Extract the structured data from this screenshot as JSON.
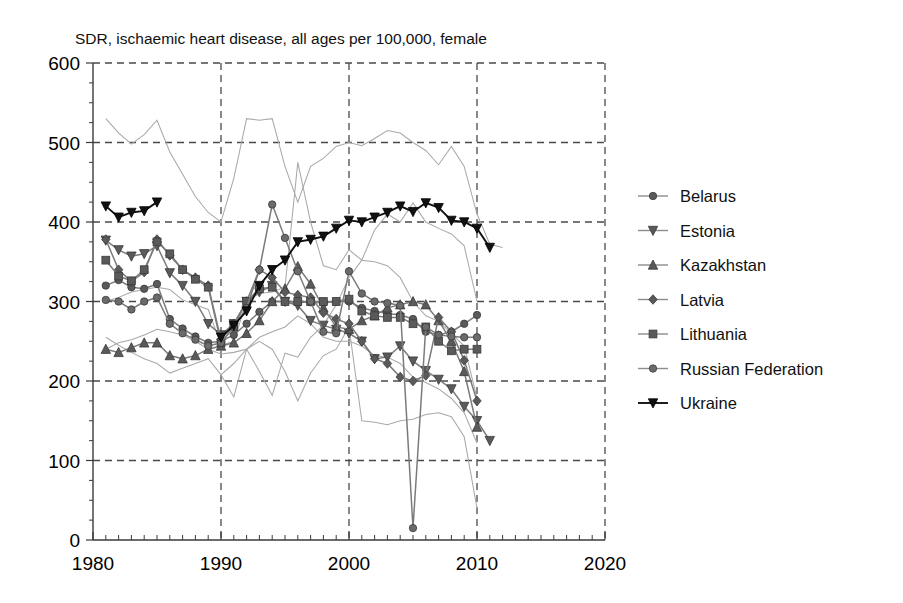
{
  "chart_data": {
    "type": "line",
    "title": "SDR, ischaemic heart disease, all ages per 100,000, female",
    "xlabel": "",
    "ylabel": "",
    "xlim": [
      1980,
      2020
    ],
    "ylim": [
      0,
      600
    ],
    "x_ticks": [
      "1980",
      "1990",
      "2000",
      "2010",
      "2020"
    ],
    "x_tick_values": [
      1980,
      1990,
      2000,
      2010,
      2020
    ],
    "y_ticks": [
      "0",
      "100",
      "200",
      "300",
      "400",
      "500",
      "600"
    ],
    "y_tick_values": [
      0,
      100,
      200,
      300,
      400,
      500,
      600
    ],
    "x_minor_interval": 1,
    "y_minor_interval": 25,
    "grid": "dashed-both-major",
    "legend_position": "right",
    "marker_color": "#5a5a5a",
    "line_color": "#7b7b7b",
    "thin_line_color": "#a9a9a9",
    "highlight_color": "#111111",
    "series": [
      {
        "name": "Belarus",
        "marker": "circle",
        "color": "#5a5a5a",
        "x": [
          1981,
          1982,
          1983,
          1984,
          1985,
          1986,
          1987,
          1988,
          1989,
          1990,
          1991,
          1992,
          1993,
          1994,
          1995,
          1996,
          1997,
          1998,
          1999,
          2000,
          2001,
          2002,
          2003,
          2004,
          2005,
          2006,
          2007,
          2008,
          2009,
          2010
        ],
        "y": [
          320,
          327,
          318,
          316,
          322,
          278,
          266,
          256,
          248,
          250,
          258,
          272,
          287,
          300,
          300,
          299,
          299,
          298,
          300,
          300,
          292,
          288,
          285,
          283,
          278,
          262,
          258,
          262,
          272,
          283
        ]
      },
      {
        "name": "Estonia",
        "marker": "triangle-down",
        "color": "#5a5a5a",
        "x": [
          1981,
          1982,
          1983,
          1984,
          1985,
          1986,
          1987,
          1988,
          1989,
          1990,
          1991,
          1992,
          1993,
          1994,
          1995,
          1996,
          1997,
          1998,
          1999,
          2000,
          2001,
          2002,
          2003,
          2004,
          2005,
          2006,
          2007,
          2008,
          2009,
          2010,
          2011
        ],
        "y": [
          377,
          365,
          357,
          360,
          370,
          336,
          320,
          300,
          272,
          258,
          272,
          300,
          312,
          320,
          300,
          295,
          276,
          270,
          265,
          260,
          250,
          228,
          230,
          244,
          225,
          213,
          202,
          190,
          168,
          150,
          125
        ]
      },
      {
        "name": "Kazakhstan",
        "marker": "triangle-up",
        "color": "#5a5a5a",
        "x": [
          1981,
          1982,
          1983,
          1984,
          1985,
          1986,
          1987,
          1988,
          1989,
          1990,
          1991,
          1992,
          1993,
          1994,
          1995,
          1996,
          1997,
          1998,
          1999,
          2000,
          2001,
          2002,
          2003,
          2004,
          2005,
          2006,
          2007,
          2008,
          2009,
          2010
        ],
        "y": [
          240,
          236,
          242,
          248,
          248,
          232,
          228,
          232,
          240,
          244,
          248,
          260,
          276,
          300,
          316,
          344,
          322,
          292,
          268,
          265,
          276,
          282,
          292,
          296,
          300,
          296,
          276,
          250,
          212,
          142
        ]
      },
      {
        "name": "Latvia",
        "marker": "diamond",
        "color": "#5a5a5a",
        "x": [
          1981,
          1982,
          1983,
          1984,
          1985,
          1986,
          1987,
          1988,
          1989,
          1990,
          1991,
          1992,
          1993,
          1994,
          1995,
          1996,
          1997,
          1998,
          1999,
          2000,
          2001,
          2002,
          2003,
          2004,
          2005,
          2006,
          2007,
          2008,
          2009,
          2010
        ],
        "y": [
          378,
          340,
          325,
          337,
          378,
          358,
          340,
          330,
          320,
          252,
          272,
          300,
          340,
          330,
          312,
          308,
          305,
          286,
          278,
          272,
          250,
          228,
          222,
          205,
          200,
          207,
          280,
          262,
          226,
          175
        ]
      },
      {
        "name": "Lithuania",
        "marker": "square",
        "color": "#5a5a5a",
        "x": [
          1981,
          1982,
          1983,
          1984,
          1985,
          1986,
          1987,
          1988,
          1989,
          1990,
          1991,
          1992,
          1993,
          1994,
          1995,
          1996,
          1997,
          1998,
          1999,
          2000,
          2001,
          2002,
          2003,
          2004,
          2005,
          2006,
          2007,
          2008,
          2009,
          2010
        ],
        "y": [
          352,
          332,
          326,
          340,
          375,
          360,
          340,
          328,
          318,
          248,
          268,
          300,
          316,
          318,
          300,
          300,
          300,
          300,
          300,
          303,
          288,
          282,
          280,
          280,
          272,
          268,
          250,
          238,
          240,
          240
        ]
      },
      {
        "name": "Russian Federation",
        "marker": "circle",
        "color": "#6b6b6b",
        "x": [
          1981,
          1982,
          1983,
          1984,
          1985,
          1986,
          1987,
          1988,
          1989,
          1990,
          1991,
          1992,
          1993,
          1994,
          1995,
          1996,
          1997,
          1998,
          1999,
          2000,
          2001,
          2002,
          2003,
          2004,
          2005,
          2006,
          2007,
          2008,
          2009,
          2010
        ],
        "y": [
          302,
          300,
          290,
          300,
          305,
          272,
          260,
          252,
          244,
          248,
          268,
          292,
          340,
          422,
          380,
          338,
          300,
          262,
          260,
          338,
          310,
          300,
          298,
          295,
          15,
          268,
          258,
          256,
          255,
          255
        ]
      },
      {
        "name": "Ukraine",
        "marker": "triangle-down-filled",
        "color": "#111111",
        "x": [
          1981,
          1982,
          1983,
          1984,
          1985,
          1986,
          1987,
          1988,
          1989,
          1990,
          1991,
          1992,
          1993,
          1994,
          1995,
          1996,
          1997,
          1998,
          1999,
          2000,
          2001,
          2002,
          2003,
          2004,
          2005,
          2006,
          2007,
          2008,
          2009,
          2010,
          2011
        ],
        "y": [
          420,
          406,
          412,
          414,
          425,
          null,
          null,
          null,
          null,
          255,
          270,
          288,
          320,
          340,
          352,
          375,
          378,
          382,
          392,
          402,
          400,
          406,
          412,
          420,
          413,
          424,
          418,
          402,
          400,
          392,
          368
        ]
      },
      {
        "name": "unlabeled-high-1",
        "marker": "none",
        "color": "#a9a9a9",
        "x": [
          1981,
          1982,
          1983,
          1984,
          1985,
          1986,
          1987,
          1988,
          1989,
          1990,
          1991,
          1992,
          1993,
          1994,
          1995,
          1996,
          1997,
          1998,
          1999,
          2000,
          2001,
          2002,
          2003,
          2004,
          2005,
          2006,
          2007,
          2008,
          2009,
          2010,
          2011,
          2012
        ],
        "y": [
          530,
          512,
          498,
          510,
          528,
          488,
          460,
          432,
          412,
          400,
          455,
          530,
          528,
          530,
          470,
          425,
          470,
          480,
          495,
          500,
          496,
          505,
          515,
          512,
          500,
          490,
          472,
          495,
          470,
          410,
          372,
          368
        ]
      },
      {
        "name": "unlabeled-high-2",
        "marker": "none",
        "color": "#a9a9a9",
        "x": [
          1981,
          1982,
          1983,
          1984,
          1985,
          1986,
          1987,
          1988,
          1989,
          1990,
          1991,
          1992,
          1993,
          1994,
          1995,
          1996,
          1997,
          1998,
          1999,
          2000,
          2001,
          2002,
          2003,
          2004,
          2005,
          2006,
          2007,
          2008,
          2009,
          2010
        ],
        "y": [
          300,
          305,
          312,
          315,
          318,
          315,
          302,
          296,
          290,
          245,
          250,
          300,
          310,
          312,
          318,
          475,
          400,
          345,
          340,
          365,
          352,
          350,
          345,
          330,
          300,
          282,
          275,
          260,
          244,
          178
        ]
      },
      {
        "name": "unlabeled-mid-1",
        "marker": "none",
        "color": "#a9a9a9",
        "x": [
          1981,
          1982,
          1983,
          1984,
          1985,
          1986,
          1987,
          1988,
          1989,
          1990,
          1991,
          1992,
          1993,
          1994,
          1995,
          1996,
          1997,
          1998,
          1999,
          2000,
          2001,
          2002,
          2003,
          2004,
          2005,
          2006,
          2007,
          2008,
          2009,
          2010
        ],
        "y": [
          255,
          245,
          236,
          228,
          222,
          210,
          216,
          222,
          228,
          208,
          222,
          240,
          255,
          262,
          268,
          282,
          272,
          255,
          250,
          250,
          244,
          232,
          230,
          222,
          205,
          198,
          190,
          178,
          160,
          122
        ]
      },
      {
        "name": "unlabeled-mid-2",
        "marker": "none",
        "color": "#a9a9a9",
        "x": [
          1981,
          1982,
          1983,
          1984,
          1985,
          1986,
          1987,
          1988,
          1989,
          1990,
          1991,
          1992,
          1993,
          1994,
          1995,
          1996,
          1997,
          1998,
          1999,
          2000,
          2001,
          2002,
          2003,
          2004,
          2005,
          2006,
          2007,
          2008,
          2009,
          2010
        ],
        "y": [
          240,
          248,
          252,
          258,
          265,
          262,
          258,
          250,
          240,
          234,
          236,
          240,
          212,
          182,
          235,
          230,
          255,
          270,
          296,
          330,
          352,
          390,
          410,
          400,
          424,
          400,
          392,
          385,
          370,
          300
        ]
      },
      {
        "name": "unlabeled-low-1",
        "marker": "none",
        "color": "#a9a9a9",
        "x": [
          1990,
          1991,
          1992,
          1993,
          1994,
          1995,
          1996,
          1997,
          1998,
          1999,
          2000,
          2001,
          2002,
          2003,
          2004,
          2005,
          2006,
          2007,
          2008,
          2009,
          2010
        ],
        "y": [
          208,
          180,
          240,
          250,
          240,
          212,
          175,
          210,
          232,
          240,
          268,
          150,
          148,
          145,
          150,
          152,
          158,
          160,
          155,
          130,
          40
        ]
      }
    ]
  },
  "legend": {
    "items": [
      {
        "label": "Belarus",
        "marker": "circle"
      },
      {
        "label": "Estonia",
        "marker": "triangle-down"
      },
      {
        "label": "Kazakhstan",
        "marker": "triangle-up"
      },
      {
        "label": "Latvia",
        "marker": "diamond"
      },
      {
        "label": "Lithuania",
        "marker": "square"
      },
      {
        "label": "Russian Federation",
        "marker": "circle"
      },
      {
        "label": "Ukraine",
        "marker": "triangle-down-filled"
      }
    ]
  }
}
